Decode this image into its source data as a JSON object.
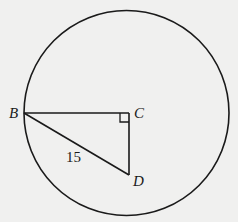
{
  "figure": {
    "shape": "circle with inscribed right triangle",
    "circle": {
      "cx": 126.5,
      "cy": 113,
      "r": 102.5
    },
    "points": {
      "B": {
        "label": "B",
        "x": 24,
        "y": 113
      },
      "C": {
        "label": "C",
        "x": 129,
        "y": 113
      },
      "D": {
        "label": "D",
        "x": 129,
        "y": 175
      }
    },
    "segment_labels": {
      "BD": "15"
    },
    "right_angle_at": "C",
    "colors": {
      "stroke": "#1a1a1a",
      "background": "#f0f0ef"
    }
  }
}
